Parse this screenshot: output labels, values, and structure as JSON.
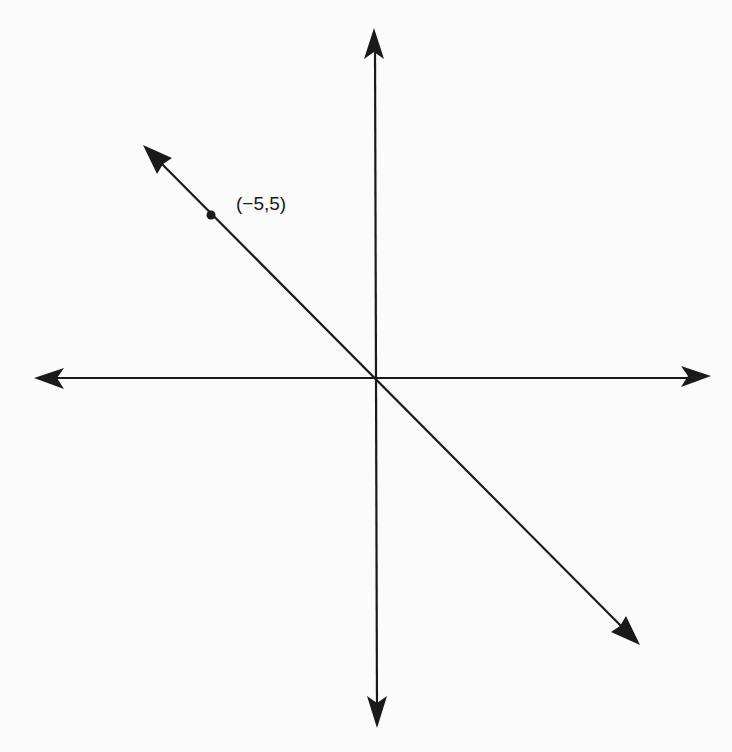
{
  "diagram": {
    "type": "coordinate-plane",
    "axes": {
      "x_axis": {
        "arrows": [
          "left",
          "right"
        ]
      },
      "y_axis": {
        "arrows": [
          "up",
          "down"
        ]
      }
    },
    "line": {
      "description": "Line through origin with slope -1",
      "slope": -1,
      "arrows": [
        "upper-left",
        "lower-right"
      ]
    },
    "points": [
      {
        "label": "(−5,5)",
        "x": -5,
        "y": 5
      }
    ],
    "colors": {
      "ink": "#1a1a1a",
      "background": "#fbfbfb"
    }
  }
}
